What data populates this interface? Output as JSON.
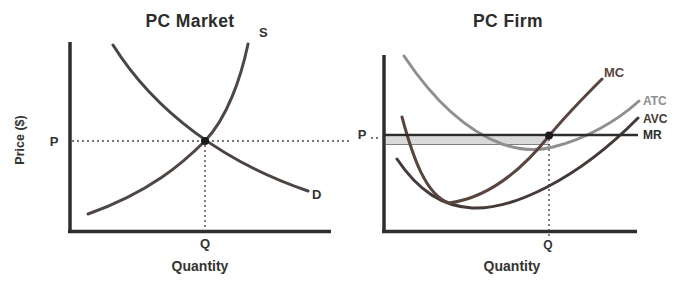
{
  "figure": {
    "market_panel": {
      "title": "PC Market",
      "y_axis_label": "Price ($)",
      "x_axis_label": "Quantity",
      "price_label": "P",
      "quantity_label": "Q",
      "supply_curve_label": "S",
      "demand_curve_label": "D"
    },
    "firm_panel": {
      "title": "PC Firm",
      "x_axis_label": "Quantity",
      "price_label": "P",
      "quantity_label": "Q",
      "mc_curve_label": "MC",
      "atc_curve_label": "ATC",
      "avc_curve_label": "AVC",
      "mr_curve_label": "MR"
    },
    "colors": {
      "axis": "#2e2e2e",
      "text": "#333333",
      "title_text": "#2c2c2c",
      "supply": "#4e4744",
      "demand": "#4a4542",
      "mc": "#5a453e",
      "atc": "#8f8f8f",
      "avc": "#443a37",
      "mr": "#2d2d2d",
      "equilibrium_dot": "#1b1b1b",
      "guide_dots": "#4a4a4a",
      "profit_band_fill": "#d9d9d9",
      "profit_band_edge": "#808080"
    }
  }
}
